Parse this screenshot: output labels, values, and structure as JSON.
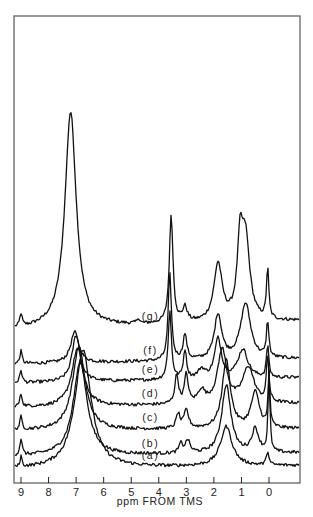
{
  "chart_data": {
    "type": "line",
    "title": "",
    "xlabel": "ppm FROM TMS",
    "ylabel": "",
    "xlim": [
      9.3,
      -1.1
    ],
    "x_reversed": true,
    "x_ticks": [
      9,
      8,
      7,
      6,
      5,
      4,
      3,
      2,
      1,
      0
    ],
    "x_tick_labels": [
      "9",
      "8",
      "7",
      "6",
      "5",
      "4",
      "3",
      "2",
      "1",
      "0"
    ],
    "grid": false,
    "legend": "none",
    "series": [
      {
        "name": "(g)",
        "label": "(g)",
        "offset": 1.95,
        "label_ppm": 4.3,
        "baseline_left": 0.0,
        "baseline_right": 0.25,
        "peaks": [
          {
            "ppm": 9.0,
            "height": 0.35,
            "width": 0.05
          },
          {
            "ppm": 7.2,
            "height": 6.0,
            "width": 0.25
          },
          {
            "ppm": 4.75,
            "height": 0.15,
            "width": 0.05
          },
          {
            "ppm": 3.55,
            "height": 3.0,
            "width": 0.08
          },
          {
            "ppm": 3.05,
            "height": 0.4,
            "width": 0.1
          },
          {
            "ppm": 1.85,
            "height": 1.6,
            "width": 0.18
          },
          {
            "ppm": 1.05,
            "height": 1.9,
            "width": 0.12
          },
          {
            "ppm": 0.85,
            "height": 2.2,
            "width": 0.18
          },
          {
            "ppm": 0.05,
            "height": 1.4,
            "width": 0.05
          }
        ]
      },
      {
        "name": "(f)",
        "label": "(f)",
        "offset": 1.0,
        "label_ppm": 4.3,
        "baseline_left": 0.0,
        "baseline_right": 0.15,
        "peaks": [
          {
            "ppm": 9.0,
            "height": 0.35,
            "width": 0.05
          },
          {
            "ppm": 7.05,
            "height": 0.85,
            "width": 0.18
          },
          {
            "ppm": 3.6,
            "height": 2.4,
            "width": 0.07
          },
          {
            "ppm": 3.05,
            "height": 0.7,
            "width": 0.08
          },
          {
            "ppm": 1.85,
            "height": 1.25,
            "width": 0.16
          },
          {
            "ppm": 0.85,
            "height": 1.55,
            "width": 0.22
          },
          {
            "ppm": 0.05,
            "height": 1.0,
            "width": 0.05
          }
        ]
      },
      {
        "name": "(e)",
        "label": "(e)",
        "offset": 0.47,
        "label_ppm": 4.3,
        "baseline_left": 0.0,
        "baseline_right": 0.15,
        "peaks": [
          {
            "ppm": 9.0,
            "height": 0.35,
            "width": 0.05
          },
          {
            "ppm": 7.0,
            "height": 1.3,
            "width": 0.18
          },
          {
            "ppm": 3.6,
            "height": 1.9,
            "width": 0.07
          },
          {
            "ppm": 3.05,
            "height": 0.8,
            "width": 0.07
          },
          {
            "ppm": 2.45,
            "height": 0.25,
            "width": 0.15
          },
          {
            "ppm": 1.85,
            "height": 1.1,
            "width": 0.15
          },
          {
            "ppm": 0.95,
            "height": 0.8,
            "width": 0.22
          },
          {
            "ppm": 0.05,
            "height": 0.9,
            "width": 0.05
          }
        ]
      },
      {
        "name": "(d)",
        "label": "(d)",
        "offset": -0.2,
        "label_ppm": 4.3,
        "baseline_left": 0.0,
        "baseline_right": 0.1,
        "peaks": [
          {
            "ppm": 9.0,
            "height": 0.35,
            "width": 0.05
          },
          {
            "ppm": 6.95,
            "height": 1.6,
            "width": 0.25
          },
          {
            "ppm": 3.35,
            "height": 0.8,
            "width": 0.08
          },
          {
            "ppm": 3.0,
            "height": 0.8,
            "width": 0.08
          },
          {
            "ppm": 2.45,
            "height": 0.35,
            "width": 0.15
          },
          {
            "ppm": 1.7,
            "height": 1.5,
            "width": 0.2
          },
          {
            "ppm": 0.75,
            "height": 1.0,
            "width": 0.25
          },
          {
            "ppm": 0.05,
            "height": 1.3,
            "width": 0.05
          }
        ]
      },
      {
        "name": "(c)",
        "label": "(c)",
        "offset": -0.85,
        "label_ppm": 4.3,
        "baseline_left": 0.0,
        "baseline_right": 0.05,
        "peaks": [
          {
            "ppm": 9.0,
            "height": 0.35,
            "width": 0.05
          },
          {
            "ppm": 6.9,
            "height": 2.3,
            "width": 0.28
          },
          {
            "ppm": 3.3,
            "height": 0.4,
            "width": 0.08
          },
          {
            "ppm": 3.0,
            "height": 0.5,
            "width": 0.1
          },
          {
            "ppm": 1.55,
            "height": 1.9,
            "width": 0.18
          },
          {
            "ppm": 0.5,
            "height": 1.0,
            "width": 0.18
          },
          {
            "ppm": 0.0,
            "height": 1.5,
            "width": 0.04
          }
        ]
      },
      {
        "name": "(b)",
        "label": "(b)",
        "offset": -1.57,
        "label_ppm": 4.3,
        "baseline_left": 0.0,
        "baseline_right": 0.1,
        "peaks": [
          {
            "ppm": 9.0,
            "height": 0.45,
            "width": 0.05
          },
          {
            "ppm": 6.85,
            "height": 2.6,
            "width": 0.3
          },
          {
            "ppm": 3.2,
            "height": 0.25,
            "width": 0.08
          },
          {
            "ppm": 2.95,
            "height": 0.35,
            "width": 0.1
          },
          {
            "ppm": 1.55,
            "height": 1.9,
            "width": 0.2
          },
          {
            "ppm": 0.5,
            "height": 0.65,
            "width": 0.15
          },
          {
            "ppm": 0.0,
            "height": 2.2,
            "width": 0.04
          }
        ]
      },
      {
        "name": "(a)",
        "label": "(a)",
        "offset": -1.92,
        "label_ppm": 4.3,
        "baseline_left": 0.0,
        "baseline_right": 0.1,
        "peaks": [
          {
            "ppm": 9.0,
            "height": 0.3,
            "width": 0.04
          },
          {
            "ppm": 6.75,
            "height": 3.3,
            "width": 0.35
          },
          {
            "ppm": 1.55,
            "height": 1.1,
            "width": 0.25
          },
          {
            "ppm": 0.05,
            "height": 0.4,
            "width": 0.05
          }
        ]
      }
    ]
  }
}
